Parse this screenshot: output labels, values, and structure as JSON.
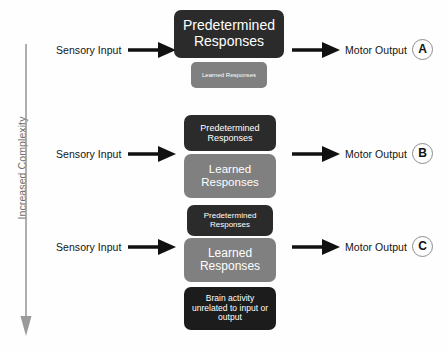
{
  "diagram": {
    "axis": {
      "label": "Increased Complexity",
      "arrow_direction": "down",
      "arrow_color": "#9a9a9a"
    },
    "colors": {
      "predetermined": "#2b2b2b",
      "learned": "#808080",
      "brain_activity": "#1c1c1c",
      "arrow": "#111111",
      "background": "#fefefe",
      "badge_border": "#8d8d8d",
      "axis_text": "#6d6d6d"
    },
    "rows": [
      {
        "id": "row-a",
        "input_label": "Sensory Input",
        "output_label": "Motor Output",
        "badge": "A",
        "boxes": [
          {
            "id": "predetermined-responses",
            "text": "Predetermined Responses",
            "style": "dark",
            "size": "large"
          },
          {
            "id": "learned-responses",
            "text": "Learned Responses",
            "style": "mid",
            "size": "tiny"
          }
        ]
      },
      {
        "id": "row-b",
        "input_label": "Sensory Input",
        "output_label": "Motor Output",
        "badge": "B",
        "boxes": [
          {
            "id": "predetermined-responses",
            "text": "Predetermined Responses",
            "style": "dark",
            "size": "small"
          },
          {
            "id": "learned-responses",
            "text": "Learned Responses",
            "style": "mid",
            "size": "medium"
          }
        ]
      },
      {
        "id": "row-c",
        "input_label": "Sensory Input",
        "output_label": "Motor Output",
        "badge": "C",
        "boxes": [
          {
            "id": "predetermined-responses",
            "text": "Predetermined Responses",
            "style": "dark",
            "size": "small"
          },
          {
            "id": "learned-responses",
            "text": "Learned Responses",
            "style": "mid",
            "size": "large"
          },
          {
            "id": "brain-activity",
            "text": "Brain activity unrelated to input or output",
            "style": "darker",
            "size": "medium"
          }
        ]
      }
    ]
  }
}
